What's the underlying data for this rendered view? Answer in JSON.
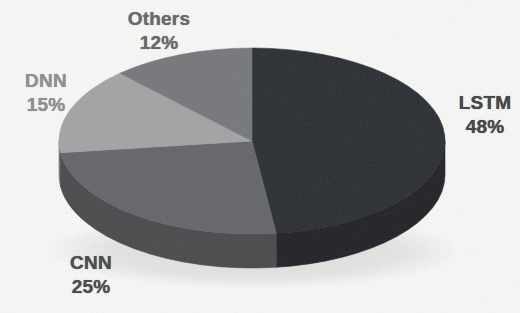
{
  "canvas": {
    "background": "#fcfcfb"
  },
  "chart_data": {
    "type": "pie",
    "style": "3d",
    "title": "",
    "legend_position": "none",
    "data_labels": "category-and-percent-outside",
    "start_angle_deg": 0,
    "direction": "clockwise",
    "categories": [
      "LSTM",
      "CNN",
      "DNN",
      "Others"
    ],
    "values": [
      48,
      25,
      15,
      12
    ],
    "slices": [
      {
        "label": "LSTM",
        "value": 48,
        "pct_text": "48%",
        "color": "#27292e",
        "label_color": "#47484c"
      },
      {
        "label": "CNN",
        "value": 25,
        "pct_text": "25%",
        "color": "#626469",
        "label_color": "#4c4d50"
      },
      {
        "label": "DNN",
        "value": 15,
        "pct_text": "15%",
        "color": "#a2a4a6",
        "label_color": "#8d8f91"
      },
      {
        "label": "Others",
        "value": 12,
        "pct_text": "12%",
        "color": "#74767a",
        "label_color": "#686a6b"
      }
    ]
  }
}
